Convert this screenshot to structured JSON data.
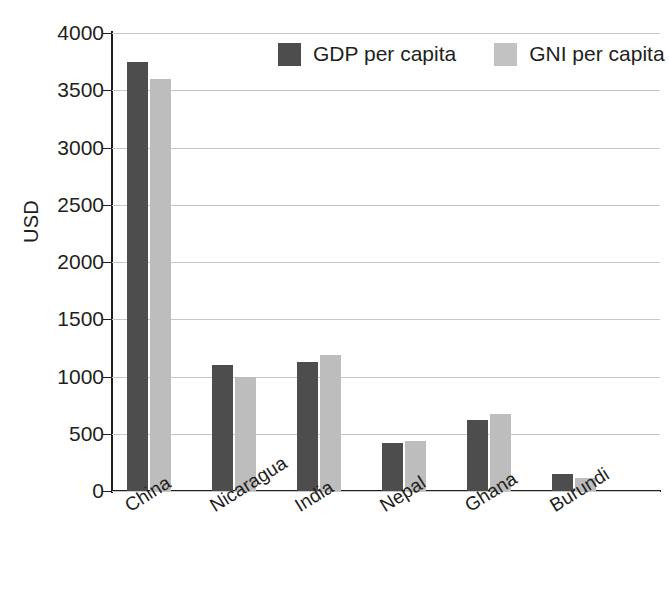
{
  "chart_data": {
    "type": "bar",
    "title": "",
    "xlabel": "",
    "ylabel": "USD",
    "ylim": [
      0,
      4000
    ],
    "ytick_step": 500,
    "yticks": [
      "4000",
      "3500",
      "3000",
      "2500",
      "2000",
      "1500",
      "1000",
      "500",
      "0"
    ],
    "ytick_values": [
      4000,
      3500,
      3000,
      2500,
      2000,
      1500,
      1000,
      500,
      0
    ],
    "grid": true,
    "legend_position": "top-center",
    "categories": [
      "China",
      "Nicaragua",
      "India",
      "Nepal",
      "Ghana",
      "Burundi"
    ],
    "series": [
      {
        "name": "GDP per capita",
        "color": "#4d4d4d",
        "values": [
          3750,
          1100,
          1130,
          415,
          620,
          150
        ]
      },
      {
        "name": "GNI per capita",
        "color": "#bdbdbd",
        "values": [
          3600,
          1000,
          1190,
          440,
          675,
          110
        ]
      }
    ]
  },
  "legend": {
    "items": [
      {
        "label": "GDP per capita",
        "color": "#4d4d4d"
      },
      {
        "label": "GNI per capita",
        "color": "#c2c2c2"
      }
    ]
  },
  "axes": {
    "y_title": "USD"
  },
  "colors": {
    "gdp": "#4d4d4d",
    "gni": "#bdbdbd",
    "axis": "#231f20",
    "grid": "#c8c8c8",
    "background": "#ffffff"
  }
}
